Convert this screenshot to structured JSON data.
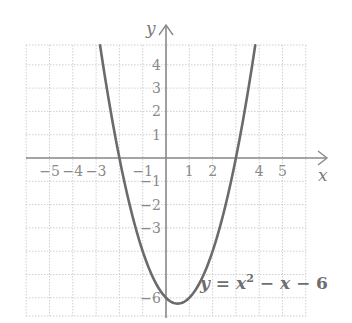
{
  "chart_data": {
    "type": "line",
    "title": "",
    "xlabel": "x",
    "ylabel": "y",
    "xlim": [
      -6,
      6
    ],
    "ylim": [
      -7,
      5
    ],
    "grid": true,
    "x_tick_labels": [
      "−5",
      "−4",
      "−3",
      "−1",
      "1",
      "2",
      "4",
      "5"
    ],
    "x_tick_values": [
      -5,
      -4,
      -3,
      -1,
      1,
      2,
      4,
      5
    ],
    "y_tick_labels": [
      "4",
      "3",
      "2",
      "1",
      "−1",
      "−2",
      "−3",
      "−6"
    ],
    "y_tick_values": [
      4,
      3,
      2,
      1,
      -1,
      -2,
      -3,
      -6
    ],
    "series": [
      {
        "name": "y = x² − x − 6",
        "equation": "y = x^2 - x - 6",
        "x": [
          -2.83,
          -2,
          -1,
          0,
          0.5,
          1,
          2,
          3,
          3.83
        ],
        "y": [
          4.85,
          0,
          -4,
          -6,
          -6.25,
          -6,
          -4,
          0,
          4.85
        ]
      }
    ],
    "annotations": [
      {
        "text": "y = x² − x − 6",
        "x": 1.5,
        "y": -5.5
      }
    ]
  },
  "labels": {
    "x_axis": "x",
    "y_axis": "y",
    "eq_y": "y",
    "eq_eq": " = ",
    "eq_x": "x",
    "eq_exp": "2",
    "eq_rest": " − ",
    "eq_x2": "x",
    "eq_tail": " − 6"
  },
  "colors": {
    "curve": "#6b6b6b",
    "axis": "#8a8a8a",
    "grid": "#cfcfcf",
    "text": "#8a8a8a"
  }
}
